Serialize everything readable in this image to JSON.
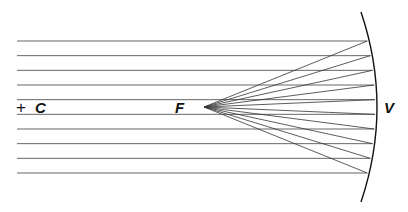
{
  "diagram": {
    "labels": {
      "center_marker": "+",
      "center": "C",
      "focus": "F",
      "vertex": "V"
    },
    "ray_count": 10,
    "colors": {
      "ink": "#111111",
      "ray": "#555555",
      "background": "#ffffff"
    }
  }
}
